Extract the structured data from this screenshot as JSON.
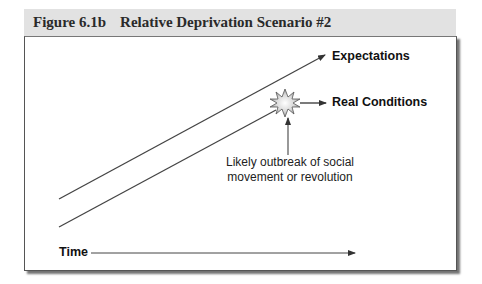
{
  "figure": {
    "number": "Figure 6.1b",
    "title": "Relative Deprivation Scenario #2"
  },
  "diagram": {
    "series": [
      {
        "name": "expectations",
        "label": "Expectations"
      },
      {
        "name": "real-conditions",
        "label": "Real Conditions"
      }
    ],
    "event": {
      "icon": "starburst-icon",
      "caption_lines": [
        "Likely outbreak of social",
        "movement or revolution"
      ]
    },
    "x_axis_label": "Time"
  }
}
